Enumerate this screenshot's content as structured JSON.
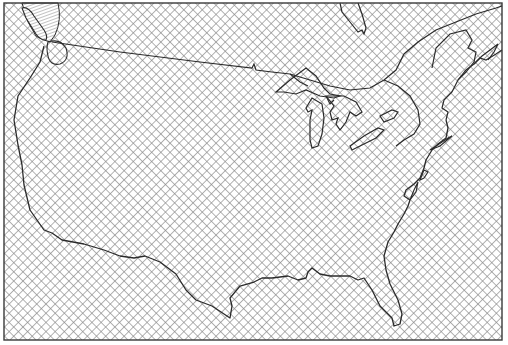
{
  "map": {
    "title": "",
    "region": "Contiguous United States",
    "style": "monochrome line map with crosshatch fill",
    "colors": {
      "background": "#ffffff",
      "hatch": "#8a8a8a",
      "outline": "#2a2a2a",
      "frame": "#3a3a3a"
    },
    "features": [
      {
        "name": "us-outline",
        "label": ""
      },
      {
        "name": "canada-border",
        "label": ""
      },
      {
        "name": "great-lakes",
        "label": ""
      },
      {
        "name": "vancouver-island",
        "label": ""
      },
      {
        "name": "nova-scotia",
        "label": ""
      },
      {
        "name": "james-bay",
        "label": ""
      }
    ],
    "labels": []
  }
}
